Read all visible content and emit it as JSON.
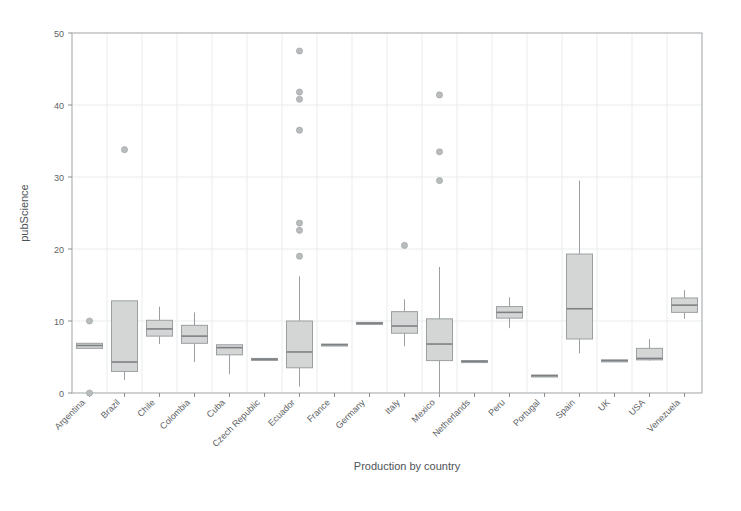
{
  "chart_data": {
    "type": "box",
    "title": "",
    "xlabel": "Production by country",
    "ylabel": "pubScience",
    "ylim": [
      0,
      50
    ],
    "yticks": [
      0,
      10,
      20,
      30,
      40,
      50
    ],
    "grid": true,
    "legend": "none",
    "categories": [
      "Argentina",
      "Brazil",
      "Chile",
      "Colombia",
      "Cuba",
      "Czech Republic",
      "Ecuador",
      "France",
      "Germany",
      "Italy",
      "Mexico",
      "Netherlands",
      "Peru",
      "Portugal",
      "Spain",
      "UK",
      "USA",
      "Venezuela"
    ],
    "boxes": [
      {
        "category": "Argentina",
        "whisker_low": 6.2,
        "q1": 6.2,
        "median": 6.6,
        "q3": 6.9,
        "whisker_high": 6.9,
        "outliers": [
          10.0,
          0.0
        ]
      },
      {
        "category": "Brazil",
        "whisker_low": 1.8,
        "q1": 3.0,
        "median": 4.3,
        "q3": 12.8,
        "whisker_high": 12.8,
        "outliers": [
          33.8
        ]
      },
      {
        "category": "Chile",
        "whisker_low": 6.8,
        "q1": 7.9,
        "median": 8.9,
        "q3": 10.1,
        "whisker_high": 12.0,
        "outliers": []
      },
      {
        "category": "Colombia",
        "whisker_low": 4.3,
        "q1": 6.9,
        "median": 7.9,
        "q3": 9.4,
        "whisker_high": 11.2,
        "outliers": []
      },
      {
        "category": "Cuba",
        "whisker_low": 2.6,
        "q1": 5.3,
        "median": 6.3,
        "q3": 6.7,
        "whisker_high": 6.7,
        "outliers": []
      },
      {
        "category": "Czech Republic",
        "whisker_low": 4.7,
        "q1": 4.7,
        "median": 4.7,
        "q3": 4.8,
        "whisker_high": 4.8,
        "outliers": []
      },
      {
        "category": "Ecuador",
        "whisker_low": 0.9,
        "q1": 3.5,
        "median": 5.7,
        "q3": 10.0,
        "whisker_high": 16.2,
        "outliers": [
          47.5,
          41.8,
          40.8,
          36.5,
          23.6,
          22.6,
          19.0
        ]
      },
      {
        "category": "France",
        "whisker_low": 6.7,
        "q1": 6.7,
        "median": 6.7,
        "q3": 6.8,
        "whisker_high": 6.8,
        "outliers": []
      },
      {
        "category": "Germany",
        "whisker_low": 9.7,
        "q1": 9.7,
        "median": 9.7,
        "q3": 9.8,
        "whisker_high": 9.8,
        "outliers": []
      },
      {
        "category": "Italy",
        "whisker_low": 6.5,
        "q1": 8.3,
        "median": 9.3,
        "q3": 11.3,
        "whisker_high": 13.0,
        "outliers": [
          20.5
        ]
      },
      {
        "category": "Mexico",
        "whisker_low": -0.3,
        "q1": 4.5,
        "median": 6.8,
        "q3": 10.3,
        "whisker_high": 17.5,
        "outliers": [
          41.4,
          33.5,
          29.5
        ]
      },
      {
        "category": "Netherlands",
        "whisker_low": 4.4,
        "q1": 4.4,
        "median": 4.4,
        "q3": 4.5,
        "whisker_high": 4.5,
        "outliers": []
      },
      {
        "category": "Peru",
        "whisker_low": 9.0,
        "q1": 10.4,
        "median": 11.2,
        "q3": 12.0,
        "whisker_high": 13.3,
        "outliers": []
      },
      {
        "category": "Portugal",
        "whisker_low": 2.4,
        "q1": 2.4,
        "median": 2.4,
        "q3": 2.5,
        "whisker_high": 2.5,
        "outliers": []
      },
      {
        "category": "Spain",
        "whisker_low": 5.5,
        "q1": 7.5,
        "median": 11.7,
        "q3": 19.3,
        "whisker_high": 29.5,
        "outliers": []
      },
      {
        "category": "UK",
        "whisker_low": 4.5,
        "q1": 4.5,
        "median": 4.5,
        "q3": 4.6,
        "whisker_high": 4.6,
        "outliers": []
      },
      {
        "category": "USA",
        "whisker_low": 4.5,
        "q1": 4.6,
        "median": 4.8,
        "q3": 6.2,
        "whisker_high": 7.5,
        "outliers": []
      },
      {
        "category": "Venezuela",
        "whisker_low": 10.3,
        "q1": 11.2,
        "median": 12.2,
        "q3": 13.2,
        "whisker_high": 14.3,
        "outliers": []
      }
    ],
    "colors": {
      "box_fill": "#d4d6d6",
      "box_stroke": "#9b9fa1",
      "median": "#7d8184",
      "grid": "#e9ebec",
      "frame": "#a9adb0",
      "text": "#5d6265",
      "background": "#ffffff"
    }
  }
}
